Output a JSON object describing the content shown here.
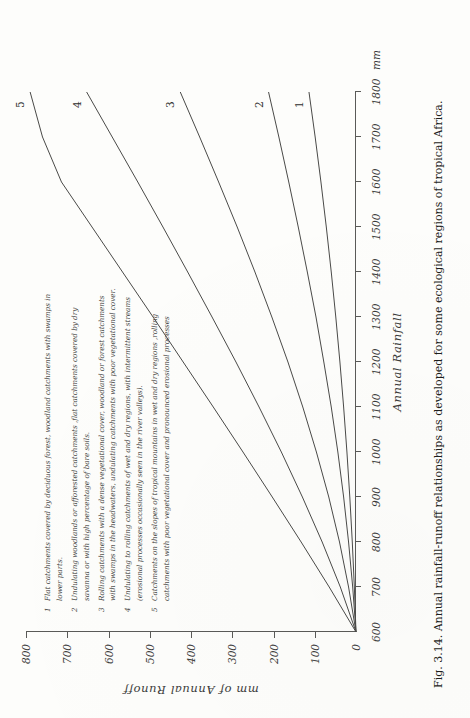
{
  "figure": {
    "caption": "Fig. 3.14. Annual rainfall-runoff relationships as developed for some ecological regions of tropical Africa.",
    "x_axis_title": "Annual  Rainfall",
    "y_axis_title": "mm  of  Annual  Runoff",
    "x_unit": "mm"
  },
  "legend": {
    "items": [
      {
        "num": "1",
        "text": "Flat catchments covered by deciduous forest, woodland catchments with swamps in lower parts."
      },
      {
        "num": "2",
        "text": "Undulating woodlands or afforested catchments ,flat catchments covered by dry savanna or with high percentage of bare soils."
      },
      {
        "num": "3",
        "text": "Rolling catchments with a dense vegetational cover, woodland or forest catchments with swamps in the headwaters, undulating catchments with poor vegetational cover."
      },
      {
        "num": "4",
        "text": "Undulating to rolling catchments of wet and dry regions, with intermittent streams (erosional processes occasionally seen in the river valleys)."
      },
      {
        "num": "5",
        "text": "Catchments on the slopes of tropical mountains in wet and dry regions ,rolling catchments with poor vegetational cover and pronounced erosional processes"
      }
    ]
  },
  "chart_data": {
    "type": "line",
    "xlabel": "Annual Rainfall",
    "ylabel": "mm of Annual Runoff",
    "xunit": "mm",
    "yunit": "mm",
    "xlim": [
      600,
      1800
    ],
    "ylim": [
      0,
      800
    ],
    "xticks": [
      600,
      700,
      800,
      900,
      1000,
      1100,
      1200,
      1300,
      1400,
      1500,
      1600,
      1700,
      1800
    ],
    "yticks": [
      0,
      100,
      200,
      300,
      400,
      500,
      600,
      700,
      800
    ],
    "grid": false,
    "legend_position": "top-left-block",
    "x": [
      600,
      700,
      800,
      900,
      1000,
      1100,
      1200,
      1300,
      1400,
      1500,
      1600,
      1700,
      1800
    ],
    "series": [
      {
        "name": "1",
        "label": "1",
        "values": [
          0,
          4,
          9,
          15,
          22,
          30,
          39,
          49,
          60,
          72,
          85,
          99,
          114
        ]
      },
      {
        "name": "2",
        "label": "2",
        "values": [
          0,
          8,
          18,
          30,
          44,
          60,
          78,
          97,
          118,
          140,
          163,
          187,
          212
        ]
      },
      {
        "name": "3",
        "label": "3",
        "values": [
          0,
          18,
          40,
          66,
          96,
          129,
          165,
          204,
          245,
          288,
          333,
          379,
          426
        ]
      },
      {
        "name": "4",
        "label": "4",
        "values": [
          0,
          38,
          82,
          130,
          181,
          235,
          291,
          349,
          408,
          468,
          529,
          591,
          653
        ]
      },
      {
        "name": "5",
        "label": "5",
        "values": [
          0,
          65,
          133,
          203,
          274,
          346,
          419,
          492,
          566,
          640,
          714,
          760,
          790
        ]
      }
    ]
  }
}
